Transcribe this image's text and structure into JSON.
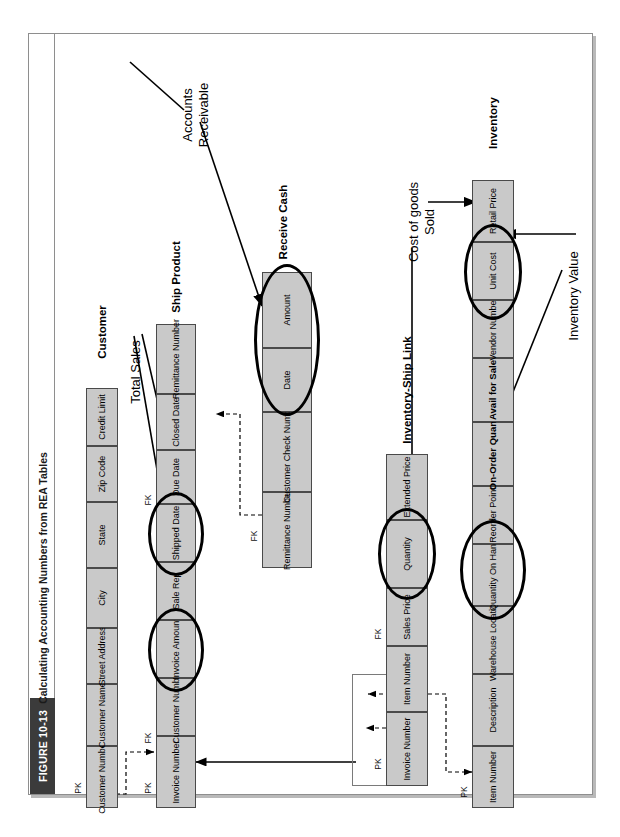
{
  "figure": {
    "tag": "FIGURE 10-13",
    "title": "Calculating Accounting Numbers from REA Tables"
  },
  "tables": [
    {
      "id": "customer",
      "name": "Customer",
      "keys": [
        {
          "label": "PK",
          "col": 0
        }
      ],
      "columns": [
        {
          "label": "Customer\nNumber",
          "bold": false,
          "circled": false
        },
        {
          "label": "Customer\nName",
          "bold": false,
          "circled": false
        },
        {
          "label": "Street\nAddress",
          "bold": false,
          "circled": false
        },
        {
          "label": "City",
          "bold": false,
          "circled": false
        },
        {
          "label": "State",
          "bold": false,
          "circled": false
        },
        {
          "label": "Zip\nCode",
          "bold": false,
          "circled": false
        },
        {
          "label": "Credit\nLimit",
          "bold": false,
          "circled": false
        }
      ]
    },
    {
      "id": "ship-product",
      "name": "Ship Product",
      "keys": [
        {
          "label": "PK",
          "col": 0
        },
        {
          "label": "FK",
          "col": 1
        },
        {
          "label": "FK",
          "col": 7
        }
      ],
      "columns": [
        {
          "label": "Invoice\nNumber",
          "bold": false,
          "circled": false
        },
        {
          "label": "Customer\nNumber",
          "bold": false,
          "circled": false
        },
        {
          "label": "Invoice\nAmount",
          "bold": false,
          "circled": true
        },
        {
          "label": "Sale\nRep",
          "bold": false,
          "circled": false
        },
        {
          "label": "Shipped\nDate",
          "bold": false,
          "circled": true
        },
        {
          "label": "Due\nDate",
          "bold": false,
          "circled": false
        },
        {
          "label": "Closed\nDate",
          "bold": false,
          "circled": false
        },
        {
          "label": "Remittance\nNumber",
          "bold": false,
          "circled": false
        }
      ]
    },
    {
      "id": "receive-cash",
      "name": "Receive Cash",
      "keys": [
        {
          "label": "FK",
          "col": 0
        }
      ],
      "columns": [
        {
          "label": "Remittance\nNumber",
          "bold": false,
          "circled": false
        },
        {
          "label": "Customer\nCheck Number",
          "bold": false,
          "circled": false
        },
        {
          "label": "Date",
          "bold": false,
          "circled": true
        },
        {
          "label": "Amount",
          "bold": false,
          "circled": true
        }
      ]
    },
    {
      "id": "inventory-ship-link",
      "name": "Inventory-Ship\nLink",
      "keys": [
        {
          "label": "PK",
          "col": 0
        },
        {
          "label": "FK",
          "col": 1
        }
      ],
      "columns": [
        {
          "label": "Invoice\nNumber",
          "bold": false,
          "circled": false
        },
        {
          "label": "Item\nNumber",
          "bold": false,
          "circled": false
        },
        {
          "label": "Sales\nPrice",
          "bold": false,
          "circled": false
        },
        {
          "label": "Quantity",
          "bold": false,
          "circled": true
        },
        {
          "label": "Extended\nPrice",
          "bold": false,
          "circled": false
        }
      ]
    },
    {
      "id": "inventory",
      "name": "Inventory",
      "keys": [
        {
          "label": "PK",
          "col": 0
        }
      ],
      "columns": [
        {
          "label": "Item\nNumber",
          "bold": false,
          "circled": false
        },
        {
          "label": "Description",
          "bold": false,
          "circled": false
        },
        {
          "label": "Warehouse\nLocation",
          "bold": false,
          "circled": false
        },
        {
          "label": "Quantity\nOn Hand",
          "bold": false,
          "circled": true
        },
        {
          "label": "Reorder\nPoint",
          "bold": false,
          "circled": false
        },
        {
          "label": "On-Order\nQuant",
          "bold": true,
          "circled": false
        },
        {
          "label": "Avail for\nSale",
          "bold": true,
          "circled": false
        },
        {
          "label": "Vendor\nNumber",
          "bold": false,
          "circled": false
        },
        {
          "label": "Unit\nCost",
          "bold": false,
          "circled": true
        },
        {
          "label": "Retail\nPrice",
          "bold": false,
          "circled": false
        }
      ]
    }
  ],
  "annotations": [
    {
      "id": "total-sales",
      "label": "Total Sales"
    },
    {
      "id": "accounts-receivable",
      "label": "Accounts\nReceivable"
    },
    {
      "id": "cost-of-goods-sold",
      "label": "Cost of goods\nSold"
    },
    {
      "id": "inventory-value",
      "label": "Inventory Value"
    }
  ],
  "colors": {
    "cell_fill": "#c9c9c9",
    "cell_border": "#4a4a4a",
    "frame_border": "#8e8e8e",
    "tag_background": "#3b3b3b",
    "line": "#000000"
  }
}
